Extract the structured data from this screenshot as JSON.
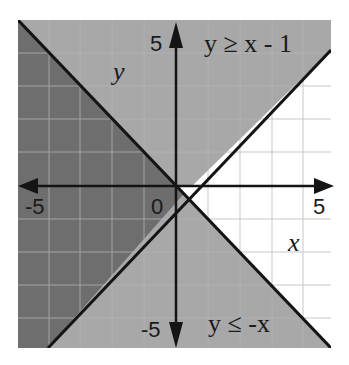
{
  "figure": {
    "type": "system-of-linear-inequalities",
    "inequalities": [
      {
        "label": "y ≥ x - 1",
        "boundary": "y = x - 1",
        "shade": "above"
      },
      {
        "label": "y ≤ -x",
        "boundary": "y = -x",
        "shade": "below"
      }
    ],
    "axes": {
      "x_label": "x",
      "y_label": "y",
      "x_min_label": "-5",
      "x_max_label": "5",
      "y_max_label": "5",
      "y_min_label": "-5",
      "origin_label": "0",
      "range": [
        -5,
        5
      ]
    },
    "colors": {
      "overlap": "#6e6e6e",
      "single_shade": "#a8a8a8",
      "unshaded": "#ffffff",
      "grid": "#b5b5b5",
      "lines": "#141414"
    }
  }
}
